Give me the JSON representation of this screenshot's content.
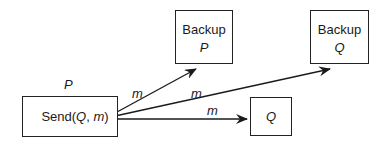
{
  "diagram": {
    "sender": {
      "process_label": "P",
      "box_text_prefix": "Send(",
      "arg1": "Q",
      "sep": ", ",
      "arg2": "m",
      "box_text_suffix": ")"
    },
    "backup_p": {
      "title": "Backup",
      "process": "P"
    },
    "backup_q": {
      "title": "Backup",
      "process": "Q"
    },
    "receiver_q": {
      "process": "Q"
    },
    "edges": [
      {
        "from": "sender",
        "to": "backup_p",
        "label": "m"
      },
      {
        "from": "sender",
        "to": "backup_q",
        "label": "m"
      },
      {
        "from": "sender",
        "to": "receiver_q",
        "label": "m"
      }
    ]
  }
}
